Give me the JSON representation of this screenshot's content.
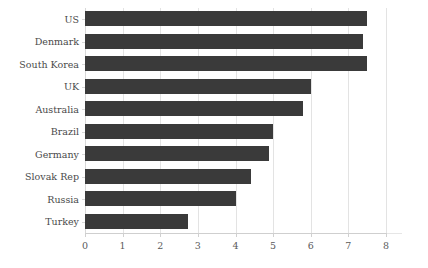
{
  "chart_data": {
    "type": "bar",
    "orientation": "horizontal",
    "title": "",
    "subtitle": "",
    "xlabel": "",
    "ylabel": "",
    "categories": [
      "US",
      "Denmark",
      "South Korea",
      "UK",
      "Australia",
      "Brazil",
      "Germany",
      "Slovak Rep",
      "Russia",
      "Turkey"
    ],
    "values": [
      7.5,
      7.4,
      7.5,
      6.0,
      5.8,
      5.0,
      4.9,
      4.4,
      4.0,
      2.75
    ],
    "xlim": [
      0,
      8
    ],
    "ylim": null,
    "xticks": [
      0,
      1,
      2,
      3,
      4,
      5,
      6,
      7,
      8
    ],
    "xticklabels": [
      "0",
      "1",
      "2",
      "3",
      "4",
      "5",
      "6",
      "7",
      "8"
    ],
    "grid": "vertical",
    "legend": null,
    "legend_position": "none",
    "bar_color": "#3a3a3a",
    "gridline_color": "#e3e3e3",
    "axis_color": "#cfcfcf",
    "background_color": "#ffffff"
  }
}
